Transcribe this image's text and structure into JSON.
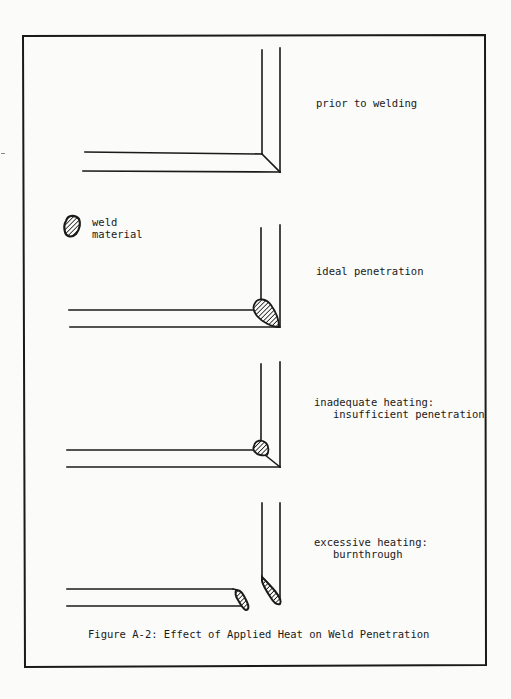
{
  "figure": {
    "caption": "Figure A-2: Effect of Applied Heat on Weld Penetration",
    "legend": {
      "icon": "hatched-weld-blob-icon",
      "line1": "weld",
      "line2": "material"
    },
    "panels": [
      {
        "id": "prior",
        "label_line1": "prior to welding",
        "label_line2": ""
      },
      {
        "id": "ideal",
        "label_line1": "ideal penetration",
        "label_line2": ""
      },
      {
        "id": "inadequate",
        "label_line1": "inadequate heating:",
        "label_line2": "   insufficient penetration"
      },
      {
        "id": "excessive",
        "label_line1": "excessive heating:",
        "label_line2": "   burnthrough"
      }
    ]
  },
  "colors": {
    "ink": "#1a1a1a",
    "paper": "#fbfbf9"
  }
}
